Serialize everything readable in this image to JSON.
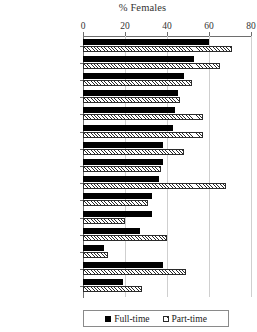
{
  "chart_data": {
    "type": "bar",
    "title": "% Females",
    "xlabel": "",
    "ylabel": "",
    "orientation": "horizontal",
    "xlim": [
      0,
      80
    ],
    "xticks": [
      0,
      20,
      40,
      60,
      80
    ],
    "grid": true,
    "legend_position": "bottom",
    "categories": [
      "Education",
      "Health Sciences",
      "All other",
      "Communications",
      "Humanities",
      "Fine arts",
      "Law",
      "Social sciences",
      "Agric & home",
      "Business",
      "Occupational",
      "Natural",
      "Engineering",
      "All staff",
      "Philosophy"
    ],
    "series": [
      {
        "name": "Full-time",
        "color": "#000000",
        "values": [
          60,
          53,
          48,
          45,
          44,
          43,
          38,
          38,
          36,
          33,
          33,
          27,
          10,
          38,
          19
        ]
      },
      {
        "name": "Part-time",
        "color": "#ffffff",
        "pattern": "diagonal-hatch",
        "values": [
          71,
          65,
          52,
          46,
          57,
          57,
          48,
          37,
          68,
          31,
          20,
          40,
          12,
          49,
          28
        ]
      }
    ]
  },
  "legend": {
    "items": [
      {
        "label": "Full-time",
        "swatch": "solid-black-square"
      },
      {
        "label": "Part-time",
        "swatch": "hatched-square"
      }
    ]
  }
}
